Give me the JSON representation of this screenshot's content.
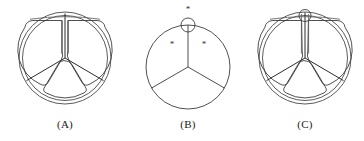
{
  "figure": {
    "background_color": "#ffffff",
    "line_color": "#3c3c3c",
    "width": 364,
    "height": 141
  },
  "panels": [
    {
      "id": "A",
      "caption": "(A)",
      "description": "Double-walled outer ring divided into three sectors by Y-shaped spokes",
      "center": {
        "x": 65,
        "y": 58
      },
      "outer_radius": 46,
      "inner_radius": 42,
      "sector_count": 3,
      "spoke_angles_deg": [
        90,
        210,
        330
      ],
      "has_top_circle": false,
      "asterisks": []
    },
    {
      "id": "B",
      "caption": "(B)",
      "description": "Single circle with three radial lines and a small circle straddling the rim at top; three asterisk markers",
      "center": {
        "x": 58,
        "y": 67
      },
      "outer_radius": 42,
      "inner_radius": 42,
      "sector_count": 3,
      "spoke_angles_deg": [
        90,
        210,
        330
      ],
      "has_top_circle": true,
      "top_circle_radius": 7,
      "asterisks": [
        {
          "label": "*",
          "x": 58,
          "y": 12,
          "position": "above-top-circle"
        },
        {
          "label": "*",
          "x": 42,
          "y": 44,
          "position": "inside-left-of-spoke"
        },
        {
          "label": "*",
          "x": 74,
          "y": 44,
          "position": "inside-right-of-spoke"
        }
      ]
    },
    {
      "id": "C",
      "caption": "(C)",
      "description": "Double-walled sectored ring as in panel A, with a small circle added at the top of the vertical spoke",
      "center": {
        "x": 59,
        "y": 58
      },
      "outer_radius": 46,
      "inner_radius": 42,
      "sector_count": 3,
      "spoke_angles_deg": [
        90,
        210,
        330
      ],
      "has_top_circle": true,
      "top_circle_radius": 6,
      "asterisks": []
    }
  ]
}
